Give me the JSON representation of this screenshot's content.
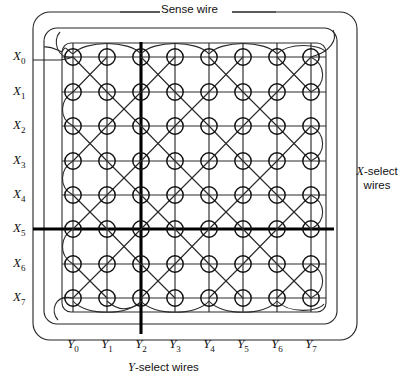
{
  "figure": {
    "kind": "magnetic-core-memory-array",
    "rows": 8,
    "cols": 8,
    "core_count": 64
  },
  "annotations": {
    "sense_wire": "Sense wire",
    "x_select_line1": "X",
    "x_select_line1b": "-select",
    "x_select_line2": "wires",
    "y_select_prefix": "Y",
    "y_select_suffix": "-select wires"
  },
  "x_labels": [
    {
      "base": "X",
      "sub": "0"
    },
    {
      "base": "X",
      "sub": "1"
    },
    {
      "base": "X",
      "sub": "2"
    },
    {
      "base": "X",
      "sub": "3"
    },
    {
      "base": "X",
      "sub": "4"
    },
    {
      "base": "X",
      "sub": "5"
    },
    {
      "base": "X",
      "sub": "6"
    },
    {
      "base": "X",
      "sub": "7"
    }
  ],
  "y_labels": [
    {
      "base": "Y",
      "sub": "0"
    },
    {
      "base": "Y",
      "sub": "1"
    },
    {
      "base": "Y",
      "sub": "2"
    },
    {
      "base": "Y",
      "sub": "3"
    },
    {
      "base": "Y",
      "sub": "4"
    },
    {
      "base": "Y",
      "sub": "5"
    },
    {
      "base": "Y",
      "sub": "6"
    },
    {
      "base": "Y",
      "sub": "7"
    }
  ],
  "highlighted": {
    "row": "X5",
    "column": "Y2",
    "row_index": 5,
    "column_index": 2
  },
  "geometry": {
    "row_y": [
      57,
      92,
      126,
      161,
      195,
      229,
      264,
      298
    ],
    "col_x": [
      73,
      107,
      141,
      175,
      209,
      243,
      277,
      311
    ],
    "core_radius": 8.2,
    "grid_frame": {
      "x": 62,
      "y": 43,
      "w": 264,
      "h": 269,
      "r": 9
    },
    "middle_loop": {
      "x": 44,
      "y": 28,
      "w": 293,
      "h": 296,
      "r": 13
    },
    "outer_loop": {
      "x": 33,
      "y": 12,
      "w": 324,
      "h": 328,
      "r": 17
    }
  },
  "colors": {
    "ink": "#111111",
    "wire": "#2b2b2b",
    "background": "#ffffff",
    "bold": "#000000"
  }
}
